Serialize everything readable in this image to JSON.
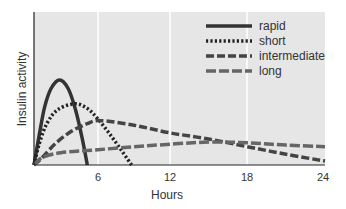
{
  "chart_data": {
    "type": "line",
    "title": "",
    "xlabel": "Hours",
    "ylabel": "Insulin activity",
    "xlim": [
      0,
      24
    ],
    "ylim": [
      0,
      100
    ],
    "x_ticks": [
      6,
      12,
      18,
      24
    ],
    "x_tick_labels": [
      "6",
      "12",
      "18",
      "24"
    ],
    "y_ticks": [],
    "grid": {
      "vertical": true,
      "horizontal": false
    },
    "legend_position": "upper right",
    "background": "#e6e6e6",
    "series": [
      {
        "name": "rapid",
        "style": "solid",
        "color": "#333333",
        "points": [
          [
            0,
            0
          ],
          [
            0.5,
            20
          ],
          [
            1,
            38
          ],
          [
            1.6,
            50
          ],
          [
            2.4,
            55.6
          ],
          [
            3.2,
            50
          ],
          [
            3.9,
            36
          ],
          [
            4.5,
            18
          ],
          [
            5.0,
            0
          ]
        ]
      },
      {
        "name": "short",
        "style": "dotted",
        "color": "#222222",
        "points": [
          [
            0,
            0
          ],
          [
            0.5,
            14
          ],
          [
            1.2,
            27
          ],
          [
            2.2,
            36
          ],
          [
            3.8,
            40
          ],
          [
            5.0,
            37
          ],
          [
            6.0,
            30
          ],
          [
            7.0,
            20
          ],
          [
            8.0,
            9
          ],
          [
            8.8,
            0
          ]
        ]
      },
      {
        "name": "intermediate",
        "style": "dashed",
        "color": "#444444",
        "points": [
          [
            0,
            0
          ],
          [
            0.8,
            5
          ],
          [
            2,
            14
          ],
          [
            3.5,
            22
          ],
          [
            5,
            27
          ],
          [
            6.2,
            29
          ],
          [
            9,
            26
          ],
          [
            12,
            21
          ],
          [
            15,
            17
          ],
          [
            18,
            12
          ],
          [
            21,
            7
          ],
          [
            24,
            2.6
          ]
        ]
      },
      {
        "name": "long",
        "style": "dashed",
        "color": "#666666",
        "points": [
          [
            0,
            0
          ],
          [
            0.8,
            5
          ],
          [
            2.5,
            8
          ],
          [
            6,
            10
          ],
          [
            10,
            12.5
          ],
          [
            15,
            15
          ],
          [
            18,
            14.5
          ],
          [
            21,
            13
          ],
          [
            24,
            12
          ]
        ]
      }
    ]
  },
  "legend": {
    "items": [
      {
        "label": "rapid"
      },
      {
        "label": "short"
      },
      {
        "label": "intermediate"
      },
      {
        "label": "long"
      }
    ]
  },
  "axes": {
    "xlabel": "Hours",
    "ylabel": "Insulin activity",
    "x_tick_labels": [
      "6",
      "12",
      "18",
      "24"
    ]
  }
}
